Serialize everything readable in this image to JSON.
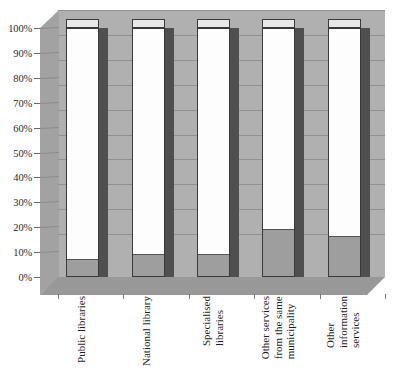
{
  "chart_data": {
    "type": "bar",
    "subtype": "100-percent-stacked-column-3d",
    "title": "",
    "subtitle": "",
    "xlabel": "",
    "ylabel": "",
    "ylim": [
      0,
      100
    ],
    "grid": true,
    "legend_position": "none",
    "categories": [
      "Public libraries",
      "National library",
      "Specialised\nlibraries",
      "Other services\nfrom the same\nmunicipality",
      "Other\ninformation\nservices"
    ],
    "y_tick_labels": [
      "0%",
      "10%",
      "20%",
      "30%",
      "40%",
      "50%",
      "60%",
      "70%",
      "80%",
      "90%",
      "100%"
    ],
    "y_tick_values": [
      0,
      10,
      20,
      30,
      40,
      50,
      60,
      70,
      80,
      90,
      100
    ],
    "series": [
      {
        "name": "Lower segment",
        "color": "#9e9e9e",
        "values": [
          7,
          9,
          9,
          19,
          16
        ]
      },
      {
        "name": "Upper segment",
        "color": "#fdfdfd",
        "values": [
          93,
          91,
          91,
          81,
          84
        ]
      }
    ]
  },
  "colors": {
    "back_wall": "#b0b0b0",
    "left_wall": "#a2a2a2",
    "floor": "#989898",
    "gridline": "#919191",
    "bar_lower": "#9e9e9e",
    "bar_upper": "#fdfdfd",
    "bar_side": "#4f4f4f",
    "bar_outline": "#3a3a3a",
    "text": "#1f1f1f",
    "background": "#ffffff"
  }
}
